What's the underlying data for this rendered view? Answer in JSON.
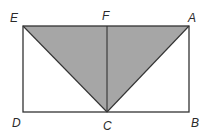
{
  "diagram": {
    "type": "geometry",
    "points": {
      "E": {
        "label": "E",
        "x": 23,
        "y": 26
      },
      "F": {
        "label": "F",
        "x": 107,
        "y": 26
      },
      "A": {
        "label": "A",
        "x": 189,
        "y": 26
      },
      "D": {
        "label": "D",
        "x": 23,
        "y": 112
      },
      "C": {
        "label": "C",
        "x": 107,
        "y": 112
      },
      "B": {
        "label": "B",
        "x": 189,
        "y": 112
      }
    },
    "shaded_region": [
      "E",
      "A",
      "C"
    ],
    "segments": [
      [
        "E",
        "A"
      ],
      [
        "A",
        "B"
      ],
      [
        "B",
        "D"
      ],
      [
        "D",
        "E"
      ],
      [
        "E",
        "C"
      ],
      [
        "A",
        "C"
      ],
      [
        "F",
        "C"
      ]
    ],
    "colors": {
      "fill": "#a6a6a6",
      "stroke": "#333333"
    }
  }
}
